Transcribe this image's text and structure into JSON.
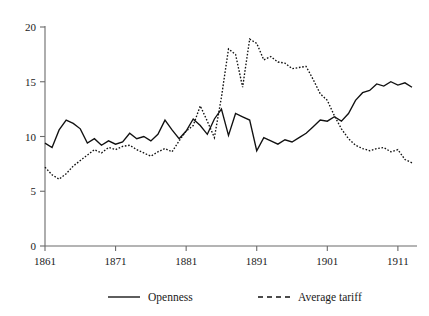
{
  "chart_data": {
    "type": "line",
    "title": "",
    "xlabel": "",
    "ylabel": "",
    "xlim": [
      1861,
      1913
    ],
    "ylim": [
      0,
      20
    ],
    "grid": false,
    "legend_position": "bottom",
    "xticks": [
      "1861",
      "1871",
      "1881",
      "1891",
      "1901",
      "1911"
    ],
    "xtick_values": [
      1861,
      1871,
      1881,
      1891,
      1901,
      1911
    ],
    "yticks": [
      "0",
      "5",
      "10",
      "15",
      "20"
    ],
    "ytick_values": [
      0,
      5,
      10,
      15,
      20
    ],
    "x": [
      1861,
      1862,
      1863,
      1864,
      1865,
      1866,
      1867,
      1868,
      1869,
      1870,
      1871,
      1872,
      1873,
      1874,
      1875,
      1876,
      1877,
      1878,
      1879,
      1880,
      1881,
      1882,
      1883,
      1884,
      1885,
      1886,
      1887,
      1888,
      1889,
      1890,
      1891,
      1892,
      1893,
      1894,
      1895,
      1896,
      1897,
      1898,
      1899,
      1900,
      1901,
      1902,
      1903,
      1904,
      1905,
      1906,
      1907,
      1908,
      1909,
      1910,
      1911,
      1912,
      1913
    ],
    "series": [
      {
        "name": "Openness",
        "style": "solid",
        "color": "#111111",
        "values": [
          9.4,
          9.0,
          10.6,
          11.5,
          11.2,
          10.7,
          9.4,
          9.8,
          9.2,
          9.6,
          9.3,
          9.5,
          10.3,
          9.8,
          10.0,
          9.6,
          10.2,
          11.5,
          10.6,
          9.8,
          10.5,
          11.6,
          11.0,
          10.2,
          11.6,
          12.5,
          10.1,
          12.1,
          11.8,
          11.5,
          8.7,
          9.9,
          9.6,
          9.3,
          9.7,
          9.5,
          9.9,
          10.3,
          10.9,
          11.5,
          11.4,
          11.8,
          11.4,
          12.1,
          13.3,
          14.0,
          14.2,
          14.8,
          14.6,
          15.0,
          14.7,
          14.9,
          14.5
        ]
      },
      {
        "name": "Average tariff",
        "style": "dashed",
        "color": "#111111",
        "values": [
          7.2,
          6.5,
          6.1,
          6.6,
          7.3,
          7.8,
          8.3,
          8.8,
          8.5,
          9.0,
          8.8,
          9.1,
          9.2,
          8.8,
          8.5,
          8.2,
          8.6,
          8.9,
          8.6,
          9.6,
          10.5,
          11.0,
          12.8,
          11.4,
          9.9,
          13.6,
          18.0,
          17.5,
          14.5,
          18.9,
          18.5,
          17.0,
          17.3,
          16.8,
          16.7,
          16.2,
          16.3,
          16.4,
          15.2,
          13.9,
          13.3,
          11.9,
          10.7,
          9.8,
          9.2,
          8.9,
          8.7,
          8.9,
          9.0,
          8.6,
          8.8,
          7.9,
          7.6
        ]
      }
    ],
    "legend": [
      {
        "label": "Openness",
        "style": "solid"
      },
      {
        "label": "Average tariff",
        "style": "dashed"
      }
    ]
  }
}
